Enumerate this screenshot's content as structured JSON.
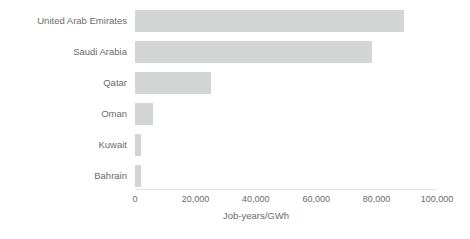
{
  "chart_data": {
    "type": "bar",
    "orientation": "horizontal",
    "title": "",
    "subtitle": "",
    "xlabel": "Job-years/GWh",
    "ylabel": "",
    "categories": [
      "United Arab Emirates",
      "Saudi Arabia",
      "Qatar",
      "Oman",
      "Kuwait",
      "Bahrain"
    ],
    "values": [
      89000,
      78500,
      25000,
      6000,
      2000,
      2000
    ],
    "xlim": [
      0,
      100000
    ],
    "xticks": [
      0,
      20000,
      40000,
      60000,
      80000,
      100000
    ],
    "xtick_labels": [
      "0",
      "20,000",
      "40,000",
      "60,000",
      "80,000",
      "100,000"
    ],
    "grid": false,
    "legend": null,
    "bar_color": "#d3d4d4",
    "text_color": "#6b6b6b",
    "axis_color": "#e2e2e2",
    "background_color": "#ffffff"
  }
}
